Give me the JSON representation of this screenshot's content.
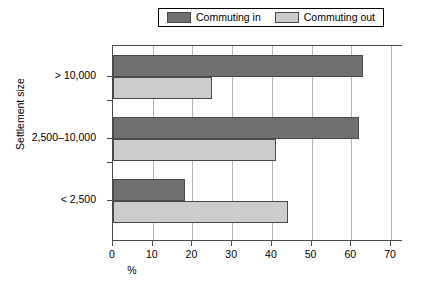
{
  "chart_data": {
    "type": "bar",
    "orientation": "horizontal",
    "title": "",
    "xlabel": "%",
    "ylabel": "Settlement size",
    "categories": [
      "> 10,000",
      "2,500–10,000",
      "< 2,500"
    ],
    "series": [
      {
        "name": "Commuting in",
        "color": "#707070",
        "values": [
          63,
          62,
          18
        ]
      },
      {
        "name": "Commuting out",
        "color": "#cccccc",
        "values": [
          25,
          41,
          44
        ]
      }
    ],
    "xlim": [
      0,
      73
    ],
    "xticks": [
      0,
      10,
      20,
      30,
      40,
      50,
      60,
      70
    ],
    "xticklabels": [
      "0",
      "10",
      "20",
      "30",
      "40",
      "50",
      "60",
      "70"
    ],
    "grid": "vertical",
    "legend_position": "top-center",
    "legend_entries": [
      "Commuting in",
      "Commuting out"
    ]
  }
}
